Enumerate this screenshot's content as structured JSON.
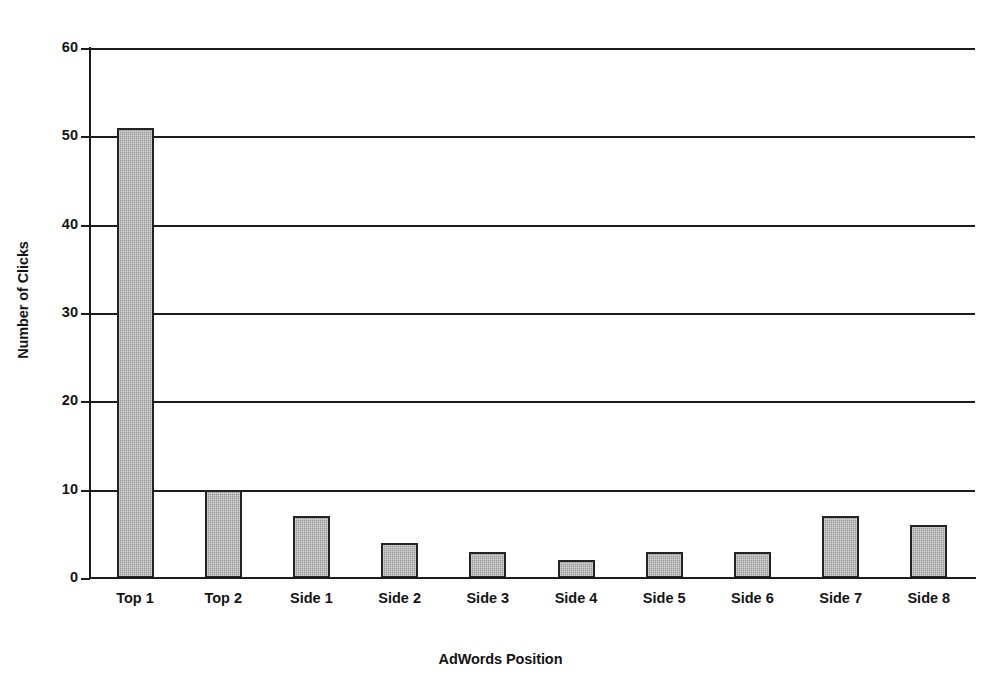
{
  "chart_data": {
    "type": "bar",
    "title": "",
    "xlabel": "AdWords Position",
    "ylabel": "Number of Clicks",
    "categories": [
      "Top 1",
      "Top 2",
      "Side 1",
      "Side 2",
      "Side 3",
      "Side 4",
      "Side 5",
      "Side 6",
      "Side 7",
      "Side 8"
    ],
    "values": [
      51,
      10,
      7,
      4,
      3,
      2,
      3,
      3,
      7,
      6
    ],
    "ylim": [
      0,
      60
    ],
    "yticks": [
      0,
      10,
      20,
      30,
      40,
      50,
      60
    ],
    "ytick_labels": [
      "0",
      "10",
      "20",
      "30",
      "40",
      "50",
      "60"
    ],
    "grid": "horizontal",
    "legend": "none",
    "bar_fill_color": "#9a9a9a",
    "bar_edge_color": "#242424",
    "axis_color": "#1c1c1c",
    "background_color": "#ffffff"
  },
  "axes": {
    "y_title": "Number of Clicks",
    "x_title": "AdWords Position"
  }
}
